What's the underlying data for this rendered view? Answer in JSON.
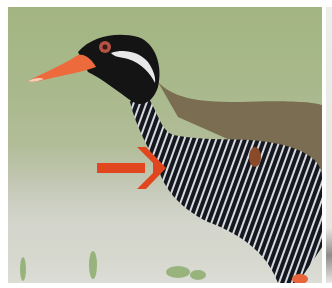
{
  "image": {
    "subject": "Okinawa rail bird in profile",
    "description": "Close-up of a rail with red-orange bill, black face with white stripe, olive-brown back and black-and-white barred underparts; a red arrow points at the barred breast.",
    "annotation": {
      "type": "arrow",
      "direction": "right",
      "color": "#e2461f",
      "target": "barred breast"
    },
    "colors": {
      "background_green": "#a6b786",
      "background_ground": "#d4d6cc",
      "bill": "#ec6a3c",
      "head": "#141414",
      "back": "#7c6e52",
      "eye_ring": "#c0584a"
    }
  }
}
